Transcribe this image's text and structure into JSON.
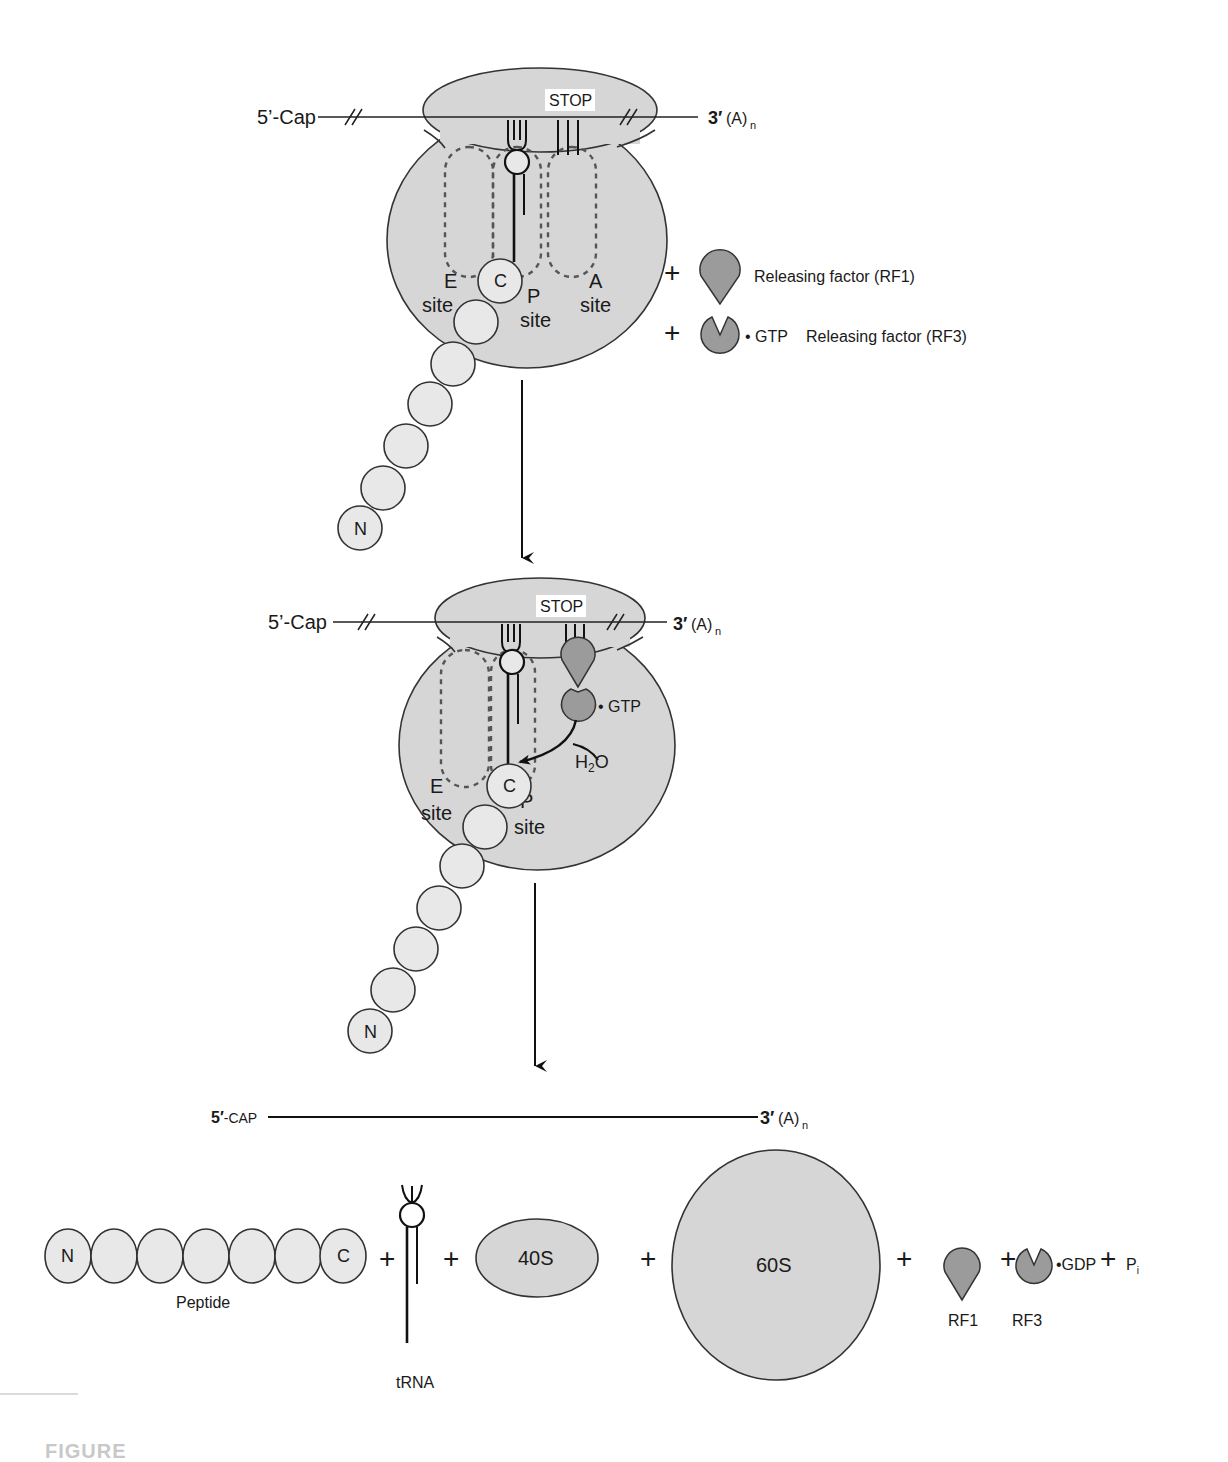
{
  "figure": {
    "footer_label": "FIGURE"
  },
  "colors": {
    "ribosome_fill": "#d6d6d6",
    "bead_fill": "#e8e8e8",
    "release_factor_fill": "#9b9b9b",
    "outline": "#333333"
  },
  "stage1": {
    "mrna_5": "5’-Cap",
    "mrna_3_prime": "3′",
    "mrna_3_tail": "(A)",
    "mrna_3_sub": "n",
    "stop_codon": "STOP",
    "sites": {
      "e": "E",
      "e_sub": "site",
      "p": "P",
      "p_sub": "site",
      "a": "A",
      "a_sub": "site"
    },
    "peptide_c": "C",
    "peptide_n": "N",
    "plus1": "+",
    "plus2": "+",
    "rf1_label": "Releasing factor (RF1)",
    "rf3_gtp": "• GTP",
    "rf3_label": "Releasing factor (RF3)"
  },
  "stage2": {
    "mrna_5": "5’-Cap",
    "mrna_3_prime": "3′",
    "mrna_3_tail": "(A)",
    "mrna_3_sub": "n",
    "stop_codon": "STOP",
    "gtp": "• GTP",
    "water": "H",
    "water_sub": "2",
    "water_o": "O",
    "sites": {
      "e": "E",
      "e_sub": "site",
      "p": "P",
      "p_sub": "site"
    },
    "peptide_c": "C",
    "peptide_n": "N"
  },
  "stage3": {
    "mrna_5_bold": "5′",
    "mrna_5": "-CAP",
    "mrna_3_prime": "3′",
    "mrna_3_tail": "(A)",
    "mrna_3_sub": "n",
    "peptide_n": "N",
    "peptide_c": "C",
    "peptide_label": "Peptide",
    "trna_label": "tRNA",
    "small_subunit": "40S",
    "large_subunit": "60S",
    "rf1_label": "RF1",
    "rf3_label": "RF3",
    "gdp": "•GDP",
    "pi": "P",
    "pi_sub": "i",
    "plus": [
      "+",
      "+",
      "+",
      "+",
      "+",
      "+"
    ]
  }
}
